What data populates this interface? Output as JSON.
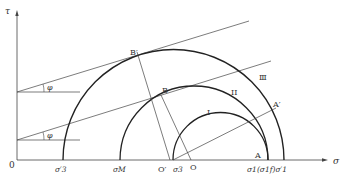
{
  "diagram": {
    "type": "mohr-circle",
    "axes": {
      "x_label": "σ",
      "y_label": "τ",
      "origin_label": "0"
    },
    "angle_label": "φ",
    "circles": [
      {
        "id": "I",
        "label": "I"
      },
      {
        "id": "II",
        "label": "II"
      },
      {
        "id": "III",
        "label": "Ⅲ"
      }
    ],
    "points": {
      "B_prime": "B′",
      "B": "B",
      "A_prime": "A′",
      "A": "A",
      "O_prime": "O′",
      "O": "O"
    },
    "axis_ticks": {
      "sigma3_prime": "σ′3",
      "sigmaM": "σM",
      "sigma3": "σ3",
      "sigma1_group": "σ1(σ1f)σ′1"
    }
  },
  "colors": {
    "line": "#333333",
    "background": "#ffffff"
  }
}
